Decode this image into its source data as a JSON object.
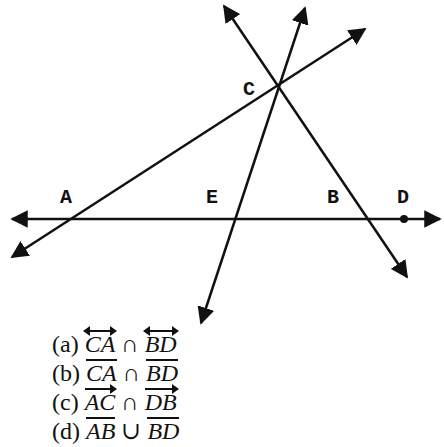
{
  "diagram": {
    "points": {
      "A": {
        "label": "A",
        "x": 78,
        "y": 219
      },
      "E": {
        "label": "E",
        "x": 234,
        "y": 219
      },
      "B": {
        "label": "B",
        "x": 366,
        "y": 219
      },
      "D": {
        "label": "D",
        "x": 404,
        "y": 219
      },
      "C": {
        "label": "C",
        "x": 275,
        "y": 88
      }
    },
    "labels": {
      "A": "A",
      "E": "E",
      "B": "B",
      "D": "D",
      "C": "C"
    }
  },
  "options": [
    {
      "key": "(a)",
      "left": "CA",
      "left_type": "line",
      "op": "∩",
      "right": "BD",
      "right_type": "line"
    },
    {
      "key": "(b)",
      "left": "CA",
      "left_type": "segment",
      "op": "∩",
      "right": "BD",
      "right_type": "segment"
    },
    {
      "key": "(c)",
      "left": "AC",
      "left_type": "ray",
      "op": "∩",
      "right": "DB",
      "right_type": "ray"
    },
    {
      "key": "(d)",
      "left": "AB",
      "left_type": "segment",
      "op": "∪",
      "right": "BD",
      "right_type": "segment"
    }
  ]
}
